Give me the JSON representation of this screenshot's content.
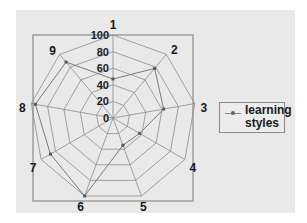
{
  "chart_data": {
    "type": "radar",
    "title": "",
    "categories": [
      "1",
      "2",
      "3",
      "4",
      "5",
      "6",
      "7",
      "8",
      "9"
    ],
    "series": [
      {
        "name": "learning styles",
        "values": [
          47,
          78,
          62,
          37,
          35,
          100,
          87,
          95,
          88
        ]
      }
    ],
    "radial_axis": {
      "min": 0,
      "max": 100,
      "ticks": [
        "0",
        "20",
        "40",
        "60",
        "80",
        "100"
      ]
    },
    "grid": true,
    "legend_position": "right"
  },
  "legend": {
    "entries": [
      {
        "label": "learning styles"
      }
    ]
  },
  "colors": {
    "background": "#e9e9e9",
    "grid": "#8c8c8c",
    "series": "#7a7a7a",
    "frame": "#8a8a8a"
  }
}
